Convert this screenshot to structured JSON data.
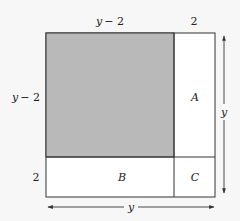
{
  "diagram": {
    "top_labels": {
      "left": "y − 2",
      "right": "2"
    },
    "left_labels": {
      "upper": "y − 2",
      "lower": "2"
    },
    "regions": {
      "shaded": {
        "label": "",
        "fill": "#b9b9b9"
      },
      "A": {
        "label": "A"
      },
      "B": {
        "label": "B"
      },
      "C": {
        "label": "C"
      }
    },
    "dimension_arrows": {
      "vertical": {
        "label": "y"
      },
      "horizontal": {
        "label": "y"
      }
    },
    "colors": {
      "background": "#f7f7f7",
      "line": "#333333",
      "shaded": "#b9b9b9",
      "white_region": "#ffffff"
    }
  }
}
